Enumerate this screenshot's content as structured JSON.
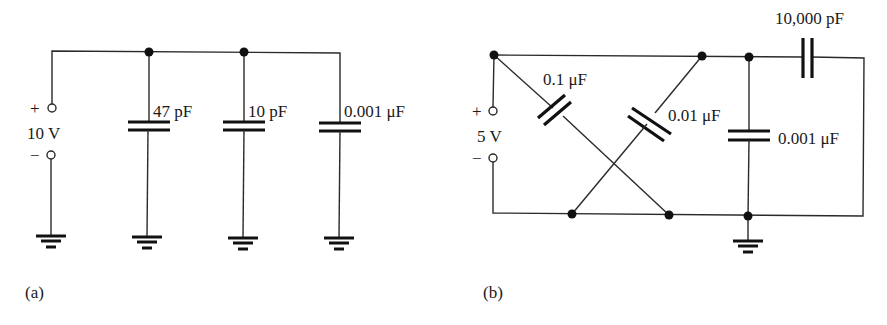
{
  "figure": {
    "panels": [
      {
        "id": "a",
        "caption": "(a)",
        "source": {
          "plus": "+",
          "minus": "−",
          "voltage": "10 V"
        },
        "capacitors": [
          {
            "label": "47 pF"
          },
          {
            "label": "10 pF"
          },
          {
            "label": "0.001 μF"
          }
        ]
      },
      {
        "id": "b",
        "caption": "(b)",
        "source": {
          "plus": "+",
          "minus": "−",
          "voltage": "5 V"
        },
        "capacitors": [
          {
            "label": "0.1 μF"
          },
          {
            "label": "0.01 μF"
          },
          {
            "label": "0.001 μF"
          },
          {
            "label": "10,000 pF"
          }
        ]
      }
    ]
  },
  "colors": {
    "ink": "#111111",
    "wire": "#2a2a2a",
    "background": "#ffffff"
  }
}
